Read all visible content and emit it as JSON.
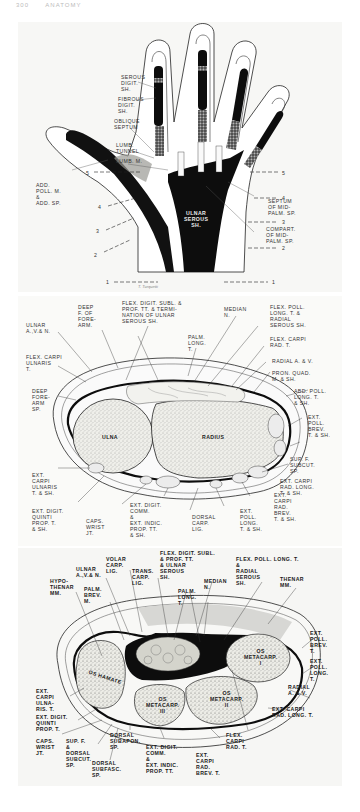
{
  "page": {
    "header_page_number": "300",
    "header_running_title": "ANATOMY"
  },
  "figure_1": {
    "title": "Palmar view of hand showing fascial spaces and synovial sheaths",
    "labels": {
      "serous_digit_sh": "SEROUS\nDIGIT.\nSH.",
      "fibrous_digit_sh": "FIBROUS\nDIGIT.\nSH.",
      "oblique_septum": "OBLIQUE\nSEPTUM",
      "lumb_tunnel": "LUMB.\nTUNNEL",
      "lumb_m": "LUMB. M.",
      "add_poll_m": "ADD.\nPOLL. M.\n&\nADD. SP.",
      "ulnar_serous_sh": "ULNAR\nSEROUS\nSH.",
      "radial_serous_sh": "RADIAL SEROUS SH.",
      "septum_mid_palm": "SEPTUM\nOF MID-\nPALM. SP.",
      "compart_mid_palm": "COMPART.\nOF MID-\nPALM. SP."
    },
    "section_lines_left": [
      "5",
      "4",
      "3",
      "2",
      "1"
    ],
    "section_lines_right": [
      "5",
      "4",
      "3",
      "2",
      "1"
    ],
    "signature": "T. Turquetti"
  },
  "figure_2": {
    "title": "Cross-section of forearm at wrist (level 1)",
    "labels": {
      "ulnar_avn": "ULNAR\nA.,V.& N.",
      "deep_f_forearm": "DEEP\nF. OF\nFORE-\nARM.",
      "flex_digit_subl": "FLEX. DIGIT. SUBL. &\nPROF. TT. & TERMI-\nNATION OF ULNAR\nSEROUS SH.",
      "median_n": "MEDIAN\nN.",
      "flex_poll_long": "FLEX. POLL.\nLONG. T. &\nRADIAL\nSEROUS SH.",
      "palm_long": "PALM.\nLONG.\nT.",
      "flex_carpi_rad": "FLEX. CARPI\nRAD. T.",
      "flex_carpi_ulnaris": "FLEX. CARPI\nULNARIS\nT.",
      "radial_av": "RADIAL A. & V.",
      "pron_quad": "PRON. QUAD.\nM. & SH.",
      "deep_forearm_sp": "DEEP\nFORE-\nARM\nSP.",
      "abd_poll_long": "ABD. POLL.\nLONG. T.\n& SH.",
      "ext_poll_brev": "EXT.\nPOLL.\nBREV.\nT. & SH.",
      "ulna": "ULNA",
      "radius": "RADIUS",
      "sup_f_subcut": "SUP. F.\nSUBCUT.\nSP.",
      "ext_carpi_ulnaris": "EXT.\nCARPI\nULNARIS\nT. & SH.",
      "ext_carpi_rad_long": "EXT. CARPI\nRAD. LONG.\nT. & SH.",
      "ext_digit_quinti": "EXT. DIGIT.\nQUINTI\nPROP. T.\n& SH.",
      "caps_wrist": "CAPS.\nWRIST\nJT.",
      "ext_digit_comm": "EXT. DIGIT.\nCOMM.\n&\nEXT. INDIC.\nPROP. TT.\n& SH.",
      "dorsal_carp_lig": "DORSAL\nCARP.\nLIG.",
      "ext_poll_long": "EXT.\nPOLL.\nLONG.\nT. & SH.",
      "ext_carpi_rad_brev": "EXT.\nCARPI\nRAD.\nBREV.\nT. & SH."
    }
  },
  "figure_3": {
    "title": "Cross-section through carpal tunnel / metacarpal bases",
    "labels": {
      "volar_carp_lig": "VOLAR\nCARP.\nLIG.",
      "ulnar_avn": "ULNAR\nA.,V.& N.",
      "trans_carp_lig": "TRANS.\nCARP.\nLIG.",
      "flex_digit_subl": "FLEX. DIGIT. SUBL.\n& PROF. TT.\n& ULNAR\nSEROUS\nSH.",
      "flex_poll_long": "FLEX. POLL. LONG. T.\n&\nRADIAL\nSEROUS\nSH.",
      "median_n": "MEDIAN\nN.",
      "hypothenar_mm": "HYPO-\nTHENAR\nMM.",
      "palm_brev_m": "PALM.\nBREV.\nM.",
      "palm_long": "PALM.\nLONG.\nT.",
      "thenar_mm": "THENAR\nMM.",
      "os_metacarp_1": "OS\nMETACARP.\nI",
      "os_hamate": "OS HAMATE",
      "os_metacarp_2": "OS\nMETACARP.\nII",
      "os_metacarp_3": "OS\nMETACARP.\nIII",
      "ext_poll_brev": "EXT.\nPOLL.\nBREV.\nT.",
      "ext_poll_long": "EXT.\nPOLL.\nLONG.\nT.",
      "ext_carpi_ulnaris": "EXT.\nCARPI\nULNA-\nRIS. T.",
      "radial_av": "RADIAL\nA. & V.",
      "ext_digit_quinti": "EXT. DIGIT.\nQUINTI\nPROP. T.",
      "ext_carpi_rad_long": "EXT. CARPI\nRAD. LONG. T.",
      "caps_wrist": "CAPS.\nWRIST\nJT.",
      "sup_f_dorsal_subcut": "SUP. F.\n&\nDORSAL\nSUBCUT.\nSP.",
      "dorsal_subapon": "DORSAL\nSUBAPON.\nSP.",
      "flex_carpi_rad": "FLEX.\nCARPI\nRAD. T.",
      "dorsal_subfasc": "DORSAL\nSUBFASC.\nSP.",
      "ext_digit_comm": "EXT. DIGIT.\nCOMM.\n&\nEXT. INDIC.\nPROP. TT.",
      "ext_carpi_rad_brev": "EXT.\nCARPI\nRAD.\nBREV. T."
    }
  },
  "colors": {
    "ink": "#111111",
    "bone_fill": "#e6e6e0",
    "sheath_dark": "#0d0d0d",
    "plate_bg": "#f7f7f5"
  }
}
